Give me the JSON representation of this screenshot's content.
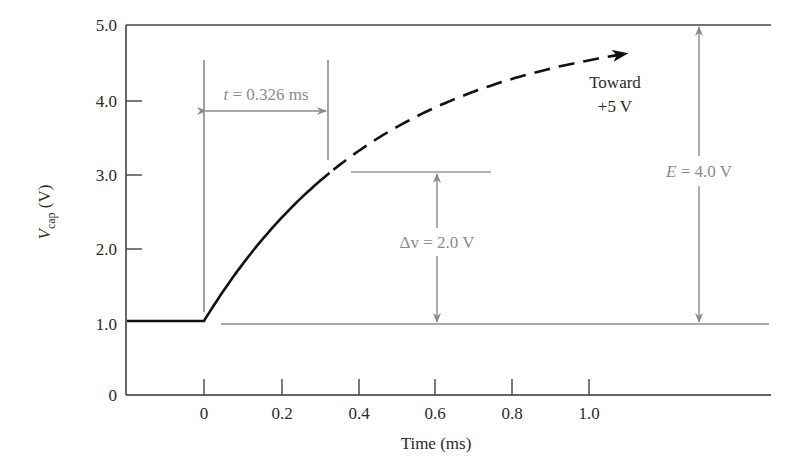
{
  "chart_data": {
    "type": "line",
    "title": "",
    "xlabel": "Time (ms)",
    "ylabel": "V_cap (V)",
    "ylabel_main": "V",
    "ylabel_sub": "cap",
    "ylabel_unit": " (V)",
    "xlim": [
      -0.2,
      1.5
    ],
    "ylim": [
      0,
      5.0
    ],
    "x_ticks": [
      0,
      0.2,
      0.4,
      0.6,
      0.8,
      1.0
    ],
    "x_tick_labels": [
      "0",
      "0.2",
      "0.4",
      "0.6",
      "0.8",
      "1.0"
    ],
    "y_ticks": [
      0,
      1.0,
      2.0,
      3.0,
      4.0,
      5.0
    ],
    "y_tick_labels": [
      "0",
      "1.0",
      "2.0",
      "3.0",
      "4.0",
      "5.0"
    ],
    "grid": false,
    "series": [
      {
        "name": "V_cap (solid, measured)",
        "style": "solid",
        "x": [
          -0.2,
          0,
          0.05,
          0.1,
          0.15,
          0.2,
          0.25,
          0.3,
          0.326
        ],
        "y": [
          1.0,
          1.0,
          1.4,
          1.77,
          2.09,
          2.38,
          2.64,
          2.87,
          3.0
        ]
      },
      {
        "name": "V_cap (dashed, projected toward +5 V)",
        "style": "dashed",
        "x": [
          0.326,
          0.4,
          0.5,
          0.6,
          0.7,
          0.8,
          0.9,
          1.0,
          1.1
        ],
        "y": [
          3.0,
          3.29,
          3.62,
          3.89,
          4.1,
          4.27,
          4.41,
          4.52,
          4.61
        ]
      }
    ],
    "reference_lines": [
      {
        "y": 5.0,
        "label": "5 V asymptote"
      },
      {
        "y": 1.0,
        "label": "initial 1.0 V"
      },
      {
        "y": 3.0,
        "label": "3.0 V level"
      }
    ],
    "annotations": [
      {
        "text_italic": "t",
        "text": " = 0.326 ms",
        "type": "horizontal-dimension",
        "from_x": 0,
        "to_x": 0.326
      },
      {
        "text_italic": "",
        "text": "Δv = 2.0 V",
        "type": "vertical-dimension",
        "from_y": 1.0,
        "to_y": 3.0
      },
      {
        "text_italic": "E",
        "text": " = 4.0 V",
        "type": "vertical-dimension",
        "from_y": 1.0,
        "to_y": 5.0
      },
      {
        "text_line1": "Toward",
        "text_line2": "+5 V",
        "type": "arrow-label"
      }
    ],
    "colors": {
      "curve": "#111111",
      "axis": "#333333",
      "annotation": "#8a8a8a"
    }
  }
}
